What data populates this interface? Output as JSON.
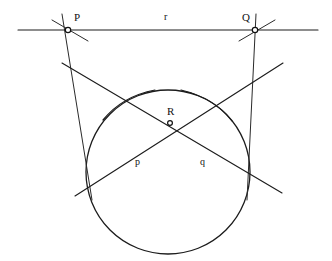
{
  "figure": {
    "kind": "euclidean-construction-diagram",
    "background_color": "#ffffff",
    "ink_color": "#1c1c1c",
    "width": 332,
    "height": 261
  },
  "labels": {
    "point_p": "P",
    "point_q": "Q",
    "point_r": "R",
    "line_r": "r",
    "line_p": "p",
    "line_q": "q"
  },
  "points": [
    {
      "name": "P",
      "x": 68,
      "y": 30
    },
    {
      "name": "Q",
      "x": 255,
      "y": 30
    },
    {
      "name": "R",
      "x": 170,
      "y": 123
    }
  ],
  "circle": {
    "center_x": 168,
    "center_y": 172,
    "radius": 82
  },
  "lines": {
    "r": {
      "label": "r",
      "x1": 18,
      "y1": 30,
      "x2": 318,
      "y2": 30
    },
    "p": {
      "label": "p",
      "x1": 75,
      "y1": 196,
      "x2": 283,
      "y2": 63
    },
    "q": {
      "label": "q",
      "x1": 62,
      "y1": 63,
      "x2": 282,
      "y2": 193
    }
  },
  "label_positions": {
    "P": {
      "x": 74,
      "y": 12
    },
    "Q": {
      "x": 242,
      "y": 12
    },
    "R": {
      "x": 167,
      "y": 106
    },
    "r": {
      "x": 164,
      "y": 12
    },
    "p": {
      "x": 135,
      "y": 157
    },
    "q": {
      "x": 200,
      "y": 157
    }
  }
}
